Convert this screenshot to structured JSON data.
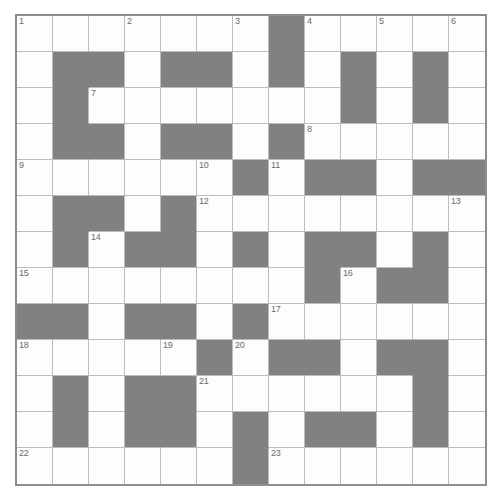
{
  "puzzle": {
    "type": "crossword-grid",
    "columns": 13,
    "rows": 13,
    "cell_size_px": 36,
    "colors": {
      "block": "#818181",
      "open": "#fdfdfd",
      "grid_line": "#bdbdbd",
      "border": "#8c8c8c",
      "number_text": "#6b6b6b",
      "page_background": "#ffffff"
    },
    "legend": {
      "open_cell": "white letter square",
      "block_cell": "shaded blocked square"
    },
    "cells": [
      [
        "open",
        "open",
        "open",
        "open",
        "open",
        "open",
        "open",
        "block",
        "open",
        "open",
        "open",
        "open",
        "open"
      ],
      [
        "open",
        "block",
        "block",
        "open",
        "block",
        "block",
        "open",
        "block",
        "open",
        "block",
        "open",
        "block",
        "open"
      ],
      [
        "open",
        "block",
        "open",
        "open",
        "open",
        "open",
        "open",
        "open",
        "open",
        "block",
        "open",
        "block",
        "open"
      ],
      [
        "open",
        "block",
        "block",
        "open",
        "block",
        "block",
        "open",
        "block",
        "open",
        "open",
        "open",
        "open",
        "open"
      ],
      [
        "open",
        "open",
        "open",
        "open",
        "open",
        "open",
        "block",
        "open",
        "block",
        "block",
        "open",
        "block",
        "block"
      ],
      [
        "open",
        "block",
        "block",
        "open",
        "block",
        "open",
        "open",
        "open",
        "open",
        "open",
        "open",
        "open",
        "open"
      ],
      [
        "open",
        "block",
        "open",
        "block",
        "block",
        "open",
        "block",
        "open",
        "block",
        "block",
        "open",
        "block",
        "open"
      ],
      [
        "open",
        "open",
        "open",
        "open",
        "open",
        "open",
        "open",
        "open",
        "block",
        "open",
        "block",
        "block",
        "open"
      ],
      [
        "block",
        "block",
        "open",
        "block",
        "block",
        "open",
        "block",
        "open",
        "open",
        "open",
        "open",
        "open",
        "open"
      ],
      [
        "open",
        "open",
        "open",
        "open",
        "open",
        "block",
        "open",
        "block",
        "block",
        "open",
        "block",
        "block",
        "open"
      ],
      [
        "open",
        "block",
        "open",
        "block",
        "block",
        "open",
        "open",
        "open",
        "open",
        "open",
        "open",
        "block",
        "open"
      ],
      [
        "open",
        "block",
        "open",
        "block",
        "block",
        "open",
        "block",
        "open",
        "block",
        "block",
        "open",
        "block",
        "open"
      ],
      [
        "open",
        "open",
        "open",
        "open",
        "open",
        "open",
        "block",
        "open",
        "open",
        "open",
        "open",
        "open",
        "open"
      ]
    ],
    "numbers": [
      {
        "number": "1",
        "row": 1,
        "col": 1
      },
      {
        "number": "2",
        "row": 1,
        "col": 4
      },
      {
        "number": "3",
        "row": 1,
        "col": 7
      },
      {
        "number": "4",
        "row": 1,
        "col": 9
      },
      {
        "number": "5",
        "row": 1,
        "col": 11
      },
      {
        "number": "6",
        "row": 1,
        "col": 13
      },
      {
        "number": "7",
        "row": 3,
        "col": 3
      },
      {
        "number": "8",
        "row": 4,
        "col": 9
      },
      {
        "number": "9",
        "row": 5,
        "col": 1
      },
      {
        "number": "10",
        "row": 5,
        "col": 6
      },
      {
        "number": "11",
        "row": 5,
        "col": 8
      },
      {
        "number": "12",
        "row": 6,
        "col": 6
      },
      {
        "number": "13",
        "row": 6,
        "col": 13
      },
      {
        "number": "14",
        "row": 7,
        "col": 3
      },
      {
        "number": "15",
        "row": 8,
        "col": 1
      },
      {
        "number": "16",
        "row": 8,
        "col": 10
      },
      {
        "number": "17",
        "row": 9,
        "col": 8
      },
      {
        "number": "18",
        "row": 10,
        "col": 1
      },
      {
        "number": "19",
        "row": 10,
        "col": 5
      },
      {
        "number": "20",
        "row": 10,
        "col": 7
      },
      {
        "number": "21",
        "row": 11,
        "col": 6
      },
      {
        "number": "22",
        "row": 13,
        "col": 1
      },
      {
        "number": "23",
        "row": 13,
        "col": 8
      }
    ]
  }
}
